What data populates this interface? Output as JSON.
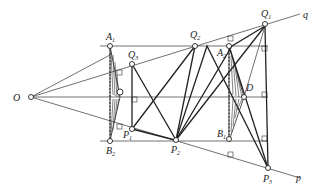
{
  "figure": {
    "labels": {
      "O": "O",
      "q": "q",
      "p": "p",
      "A1": {
        "main": "A",
        "sub": "1"
      },
      "A2": {
        "main": "A",
        "sub": "2"
      },
      "B1": {
        "main": "B",
        "sub": "1"
      },
      "B2": {
        "main": "B",
        "sub": "2"
      },
      "Q1": {
        "main": "Q",
        "sub": "1"
      },
      "Q2": {
        "main": "Q",
        "sub": "2"
      },
      "Q3": {
        "main": "Q",
        "sub": "3"
      },
      "P1": {
        "main": "P",
        "sub": "1"
      },
      "P2": {
        "main": "P",
        "sub": "2"
      },
      "P3": {
        "main": "P",
        "sub": "3"
      },
      "D": "D"
    }
  }
}
